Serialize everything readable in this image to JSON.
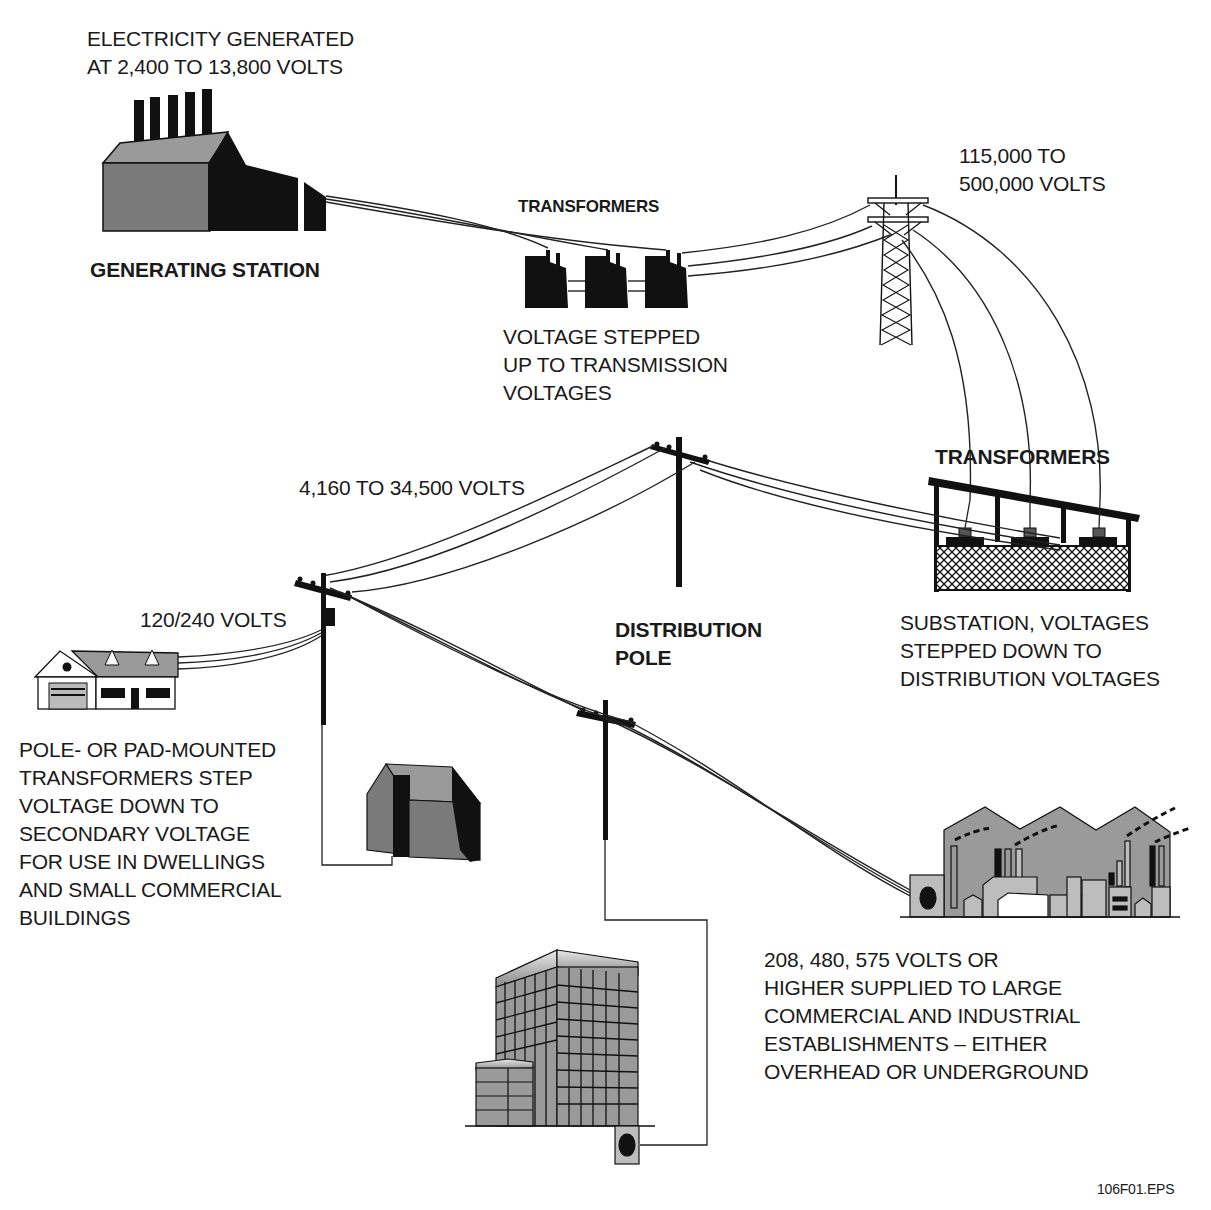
{
  "diagram": {
    "figure_id": "106F01.EPS",
    "stages": [
      {
        "id": "generating-station",
        "label": "GENERATING STATION",
        "note": "ELECTRICITY GENERATED\nAT 2,400 TO 13,800 VOLTS"
      },
      {
        "id": "step-up-transformers",
        "label": "TRANSFORMERS",
        "note": "VOLTAGE STEPPED\nUP TO TRANSMISSION\nVOLTAGES"
      },
      {
        "id": "transmission-tower",
        "note": "115,000 TO\n500,000 VOLTS"
      },
      {
        "id": "substation",
        "label": "TRANSFORMERS",
        "note": "SUBSTATION, VOLTAGES\nSTEPPED DOWN TO\nDISTRIBUTION VOLTAGES"
      },
      {
        "id": "distribution-pole",
        "label": "DISTRIBUTION\nPOLE",
        "note": "4,160 TO 34,500 VOLTS"
      },
      {
        "id": "pole-transformer",
        "note": "120/240 VOLTS",
        "description": "POLE- OR PAD-MOUNTED\nTRANSFORMERS STEP\nVOLTAGE DOWN TO\nSECONDARY VOLTAGE\nFOR USE IN DWELLINGS\nAND SMALL COMMERCIAL\nBUILDINGS"
      },
      {
        "id": "industrial",
        "note": "208, 480, 575 VOLTS OR\nHIGHER SUPPLIED TO LARGE\nCOMMERCIAL AND INDUSTRIAL\nESTABLISHMENTS – EITHER\nOVERHEAD OR UNDERGROUND"
      }
    ]
  },
  "labels": {
    "generated": "ELECTRICITY GENERATED\nAT 2,400 TO 13,800 VOLTS",
    "generating_station": "GENERATING STATION",
    "transformers_top": "TRANSFORMERS",
    "stepped_up": "VOLTAGE STEPPED\nUP TO TRANSMISSION\nVOLTAGES",
    "transmission_voltage": "115,000 TO\n500,000 VOLTS",
    "transformers_substation": "TRANSFORMERS",
    "distribution_voltage": "4,160 TO 34,500 VOLTS",
    "substation_note": "SUBSTATION, VOLTAGES\nSTEPPED DOWN TO\nDISTRIBUTION VOLTAGES",
    "distribution_pole": "DISTRIBUTION\nPOLE",
    "secondary_voltage": "120/240 VOLTS",
    "pole_mounted_note": "POLE- OR PAD-MOUNTED\nTRANSFORMERS STEP\nVOLTAGE DOWN TO\nSECONDARY VOLTAGE\nFOR USE IN DWELLINGS\nAND SMALL COMMERCIAL\nBUILDINGS",
    "industrial_note": "208, 480, 575 VOLTS OR\nHIGHER SUPPLIED TO LARGE\nCOMMERCIAL AND INDUSTRIAL\nESTABLISHMENTS – EITHER\nOVERHEAD OR UNDERGROUND",
    "figure_id": "106F01.EPS"
  },
  "colors": {
    "ink": "#111111",
    "gray_fill": "#7a7a7a",
    "light_gray": "#bdbdbd",
    "mid_gray": "#9a9a9a",
    "background": "#ffffff"
  }
}
